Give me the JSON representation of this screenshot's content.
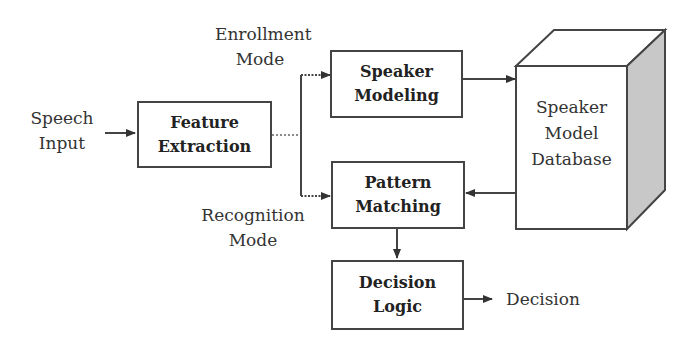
{
  "diagram": {
    "inputs": {
      "speech_input": [
        "Speech",
        "Input"
      ]
    },
    "modes": {
      "enrollment": [
        "Enrollment",
        "Mode"
      ],
      "recognition": [
        "Recognition",
        "Mode"
      ]
    },
    "boxes": {
      "feature_extraction": [
        "Feature",
        "Extraction"
      ],
      "speaker_modeling": [
        "Speaker",
        "Modeling"
      ],
      "pattern_matching": [
        "Pattern",
        "Matching"
      ],
      "decision_logic": [
        "Decision",
        "Logic"
      ]
    },
    "database": [
      "Speaker",
      "Model",
      "Database"
    ],
    "output": "Decision",
    "colors": {
      "stroke": "#444444",
      "db_side": "#c8c8c8"
    }
  }
}
